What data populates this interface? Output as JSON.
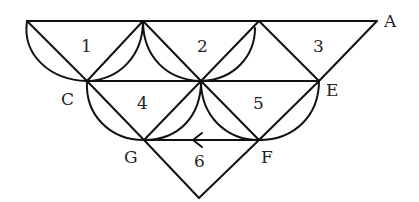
{
  "diagram": {
    "type": "graph-edge-network",
    "vertex_labels": {
      "A": "A",
      "C": "C",
      "E": "E",
      "F": "F",
      "G": "G"
    },
    "region_labels": [
      "1",
      "2",
      "3",
      "4",
      "5",
      "6"
    ],
    "arrow": {
      "edge": "F-G",
      "direction": "toward G"
    },
    "stroke_color": "#111111",
    "background": "#ffffff"
  }
}
